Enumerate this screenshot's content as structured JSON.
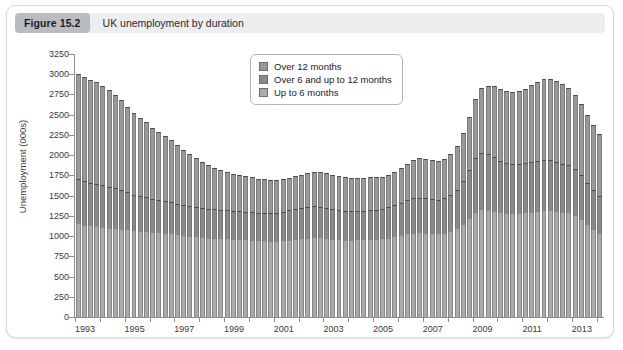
{
  "figure": {
    "badge": "Figure 15.2",
    "title": "UK unemployment by duration"
  },
  "colors": {
    "card_background": "#ffffff",
    "card_border": "#d8d8d8",
    "header_background": "#eceef0",
    "badge_background": "#b9bcc0",
    "series_up_to_6_months": "#aaaaaa",
    "series_over_6_up_to_12_months": "#8a8a8a",
    "series_over_12_months": "#999999",
    "axis": "#8e8e8e"
  },
  "chart_data": {
    "type": "bar",
    "stacked": true,
    "title": "UK unemployment by duration",
    "xlabel": "",
    "ylabel": "Unemployment (000s)",
    "ylim": [
      0,
      3250
    ],
    "ytick_step": 250,
    "yticks": [
      0,
      250,
      500,
      750,
      1000,
      1250,
      1500,
      1750,
      2000,
      2250,
      2500,
      2750,
      3000,
      3250
    ],
    "grid": false,
    "legend_position": "top-center-left",
    "xtick_labels": [
      "1993",
      "1995",
      "1997",
      "1999",
      "2001",
      "2003",
      "2005",
      "2007",
      "2009",
      "2011",
      "2013"
    ],
    "x_start_year": 1993,
    "x_end_year": 2014.25,
    "x_period": "quarterly",
    "x": [
      1993.0,
      1993.25,
      1993.5,
      1993.75,
      1994.0,
      1994.25,
      1994.5,
      1994.75,
      1995.0,
      1995.25,
      1995.5,
      1995.75,
      1996.0,
      1996.25,
      1996.5,
      1996.75,
      1997.0,
      1997.25,
      1997.5,
      1997.75,
      1998.0,
      1998.25,
      1998.5,
      1998.75,
      1999.0,
      1999.25,
      1999.5,
      1999.75,
      2000.0,
      2000.25,
      2000.5,
      2000.75,
      2001.0,
      2001.25,
      2001.5,
      2001.75,
      2002.0,
      2002.25,
      2002.5,
      2002.75,
      2003.0,
      2003.25,
      2003.5,
      2003.75,
      2004.0,
      2004.25,
      2004.5,
      2004.75,
      2005.0,
      2005.25,
      2005.5,
      2005.75,
      2006.0,
      2006.25,
      2006.5,
      2006.75,
      2007.0,
      2007.25,
      2007.5,
      2007.75,
      2008.0,
      2008.25,
      2008.5,
      2008.75,
      2009.0,
      2009.25,
      2009.5,
      2009.75,
      2010.0,
      2010.25,
      2010.5,
      2010.75,
      2011.0,
      2011.25,
      2011.5,
      2011.75,
      2012.0,
      2012.25,
      2012.5,
      2012.75,
      2013.0,
      2013.25,
      2013.5,
      2013.75,
      2014.0
    ],
    "series": [
      {
        "name": "Up to 6 months",
        "color": "#aaaaaa",
        "values": [
          1150,
          1130,
          1120,
          1110,
          1100,
          1090,
          1085,
          1080,
          1070,
          1060,
          1055,
          1050,
          1040,
          1035,
          1030,
          1025,
          1010,
          1000,
          990,
          985,
          975,
          970,
          965,
          960,
          960,
          955,
          950,
          950,
          945,
          940,
          935,
          930,
          930,
          935,
          945,
          955,
          960,
          970,
          975,
          975,
          965,
          955,
          950,
          945,
          945,
          950,
          950,
          955,
          955,
          960,
          970,
          985,
          1000,
          1020,
          1030,
          1035,
          1030,
          1025,
          1020,
          1030,
          1050,
          1085,
          1140,
          1210,
          1290,
          1320,
          1310,
          1300,
          1280,
          1270,
          1270,
          1275,
          1280,
          1290,
          1300,
          1310,
          1310,
          1300,
          1290,
          1280,
          1250,
          1200,
          1140,
          1080,
          1030
        ]
      },
      {
        "name": "Over 6 and up to 12 months",
        "color": "#8a8a8a",
        "values": [
          550,
          545,
          540,
          535,
          530,
          520,
          505,
          490,
          470,
          450,
          440,
          430,
          420,
          410,
          405,
          400,
          390,
          385,
          380,
          375,
          370,
          370,
          365,
          365,
          360,
          355,
          355,
          350,
          350,
          350,
          350,
          355,
          360,
          365,
          375,
          385,
          390,
          395,
          395,
          390,
          385,
          380,
          375,
          370,
          365,
          365,
          365,
          370,
          370,
          375,
          385,
          395,
          410,
          425,
          435,
          440,
          435,
          430,
          425,
          435,
          455,
          490,
          545,
          610,
          680,
          710,
          700,
          680,
          650,
          630,
          620,
          620,
          620,
          625,
          630,
          630,
          625,
          615,
          605,
          595,
          575,
          550,
          520,
          490,
          465
        ]
      },
      {
        "name": "Over 12 months",
        "color": "#999999",
        "values": [
          1300,
          1290,
          1275,
          1260,
          1230,
          1190,
          1150,
          1110,
          1060,
          1010,
          965,
          925,
          880,
          840,
          800,
          765,
          720,
          680,
          640,
          600,
          565,
          535,
          510,
          490,
          475,
          460,
          450,
          440,
          430,
          420,
          415,
          410,
          405,
          400,
          400,
          405,
          410,
          415,
          420,
          425,
          425,
          425,
          420,
          415,
          410,
          405,
          400,
          400,
          400,
          400,
          405,
          415,
          430,
          450,
          470,
          485,
          490,
          490,
          485,
          490,
          505,
          535,
          585,
          650,
          730,
          800,
          850,
          880,
          890,
          890,
          890,
          900,
          920,
          950,
          980,
          1000,
          1010,
          1000,
          980,
          955,
          920,
          880,
          840,
          800,
          770
        ]
      }
    ],
    "totals_note": "Stacked totals range from about 3000 in 1993 Q1, falling to about 1450 in the mid-2000s trough, rising sharply after 2008 to a peak near 2660 in late 2011, and ending near 2100.",
    "legend": [
      "Over 12 months",
      "Over 6 and up to 12 months",
      "Up to 6 months"
    ]
  }
}
